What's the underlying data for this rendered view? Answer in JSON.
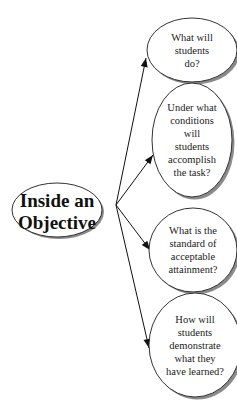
{
  "diagram": {
    "type": "concept-map",
    "central": {
      "label_lines": [
        "Inside an",
        "Objective"
      ]
    },
    "children": [
      {
        "label_lines": [
          "What will",
          "students",
          "do?"
        ]
      },
      {
        "label_lines": [
          "Under what",
          "conditions",
          "will",
          "students",
          "accomplish",
          "the task?"
        ]
      },
      {
        "label_lines": [
          "What is the",
          "standard of",
          "acceptable",
          "attainment?"
        ]
      },
      {
        "label_lines": [
          "How will",
          "students",
          "demonstrate",
          "what they",
          "have learned?"
        ]
      }
    ],
    "edges": [
      {
        "from": "central",
        "to": 0
      },
      {
        "from": "central",
        "to": 1
      },
      {
        "from": "central",
        "to": 2
      },
      {
        "from": "central",
        "to": 3
      }
    ]
  }
}
